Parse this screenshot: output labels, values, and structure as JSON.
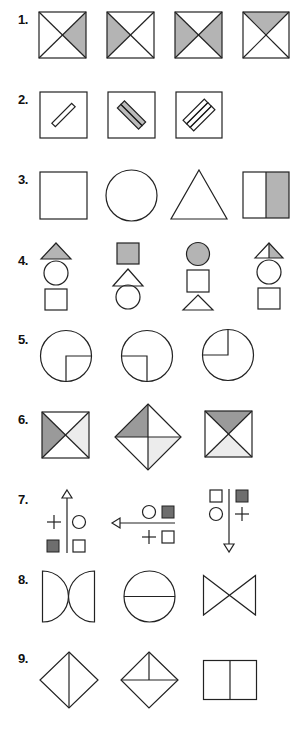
{
  "questions": [
    {
      "number": "1.",
      "description": "Squares divided by diagonals with one or two shaded triangles",
      "figures": [
        "right-triangle-shaded",
        "left-triangle-shaded",
        "left-and-right-shaded",
        "top-triangle-shaded"
      ]
    },
    {
      "number": "2.",
      "description": "Squares containing one, two and three diagonal bars",
      "figures": [
        "one-bar",
        "two-bars",
        "three-bars"
      ]
    },
    {
      "number": "3.",
      "description": "Square, circle, triangle, half-shaded square",
      "figures": [
        "square",
        "circle",
        "triangle",
        "half-shaded-square"
      ]
    },
    {
      "number": "4.",
      "description": "Stacks of three shapes, top shape shaded",
      "figures": [
        "triangle-circle-square",
        "square-triangle-circle",
        "circle-square-triangle",
        "half-triangle-circle-square"
      ]
    },
    {
      "number": "5.",
      "description": "Circles with quarter segment marked in different quadrants",
      "figures": [
        "bottom-right-quarter",
        "bottom-left-quarter",
        "top-left-quarter"
      ]
    },
    {
      "number": "6.",
      "description": "Squares/diamond divided into triangles with dark and light shading",
      "figures": [
        "left-dark-right-light",
        "diamond-topleft-dark-bottomright-light",
        "top-dark-bottom-light"
      ]
    },
    {
      "number": "7.",
      "description": "Arrows with symbols (plus, circle, filled square, empty square)",
      "figures": [
        "arrow-up",
        "arrow-left",
        "arrow-down"
      ]
    },
    {
      "number": "8.",
      "description": "Shapes built from arcs and lines",
      "figures": [
        "back-to-back-semicircles",
        "circle-with-diameter",
        "bow-tie"
      ]
    },
    {
      "number": "9.",
      "description": "Diamonds and rectangle divided by lines",
      "figures": [
        "diamond-vertical-split",
        "diamond-t-split",
        "rectangle-vertical-split"
      ]
    }
  ],
  "colors": {
    "shade": "#b4b4b4",
    "dark_shade": "#6e6e6e",
    "light_shade": "#ececec",
    "stroke": "#222222"
  }
}
